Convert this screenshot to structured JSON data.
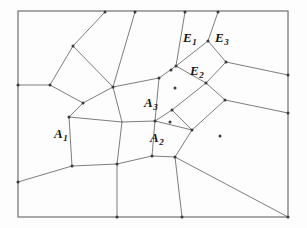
{
  "figure": {
    "background_color": "#fdfdfd",
    "line_color": "#6e6e6e",
    "border_color": "#707070",
    "vertex_color": "#3a3a3a",
    "label_color": "#141414",
    "frame": {
      "x": 18,
      "y": 11,
      "width": 270,
      "height": 206
    }
  },
  "labels": [
    {
      "id": "A1",
      "base": "A",
      "sub": "1",
      "x": 54,
      "y": 125
    },
    {
      "id": "A2",
      "base": "A",
      "sub": "2",
      "x": 150,
      "y": 129
    },
    {
      "id": "A3",
      "base": "A",
      "sub": "3",
      "x": 144,
      "y": 94
    },
    {
      "id": "E1",
      "base": "E",
      "sub": "1",
      "x": 183,
      "y": 29
    },
    {
      "id": "E2",
      "base": "E",
      "sub": "2",
      "x": 190,
      "y": 62
    },
    {
      "id": "E3",
      "base": "E",
      "sub": "3",
      "x": 215,
      "y": 29
    }
  ],
  "vertices": [
    {
      "id": "v1",
      "x": 73,
      "y": 46
    },
    {
      "id": "v2",
      "x": 50,
      "y": 85
    },
    {
      "id": "v3",
      "x": 83,
      "y": 103
    },
    {
      "id": "v4",
      "x": 69,
      "y": 117
    },
    {
      "id": "v5",
      "x": 72,
      "y": 166
    },
    {
      "id": "v6",
      "x": 117,
      "y": 164
    },
    {
      "id": "v7",
      "x": 152,
      "y": 156
    },
    {
      "id": "v8",
      "x": 175,
      "y": 157
    },
    {
      "id": "v9",
      "x": 155,
      "y": 121
    },
    {
      "id": "v10",
      "x": 170,
      "y": 122
    },
    {
      "id": "v11",
      "x": 172,
      "y": 110
    },
    {
      "id": "v12",
      "x": 192,
      "y": 130
    },
    {
      "id": "v13",
      "x": 175,
      "y": 88
    },
    {
      "id": "v14",
      "x": 171,
      "y": 70
    },
    {
      "id": "v15",
      "x": 176,
      "y": 66
    },
    {
      "id": "v16",
      "x": 206,
      "y": 83
    },
    {
      "id": "v17",
      "x": 225,
      "y": 100
    },
    {
      "id": "v18",
      "x": 208,
      "y": 41
    },
    {
      "id": "v19",
      "x": 226,
      "y": 62
    },
    {
      "id": "v20",
      "x": 220,
      "y": 136
    },
    {
      "id": "v21",
      "x": 105,
      "y": 12
    },
    {
      "id": "v22",
      "x": 135,
      "y": 12
    },
    {
      "id": "v23",
      "x": 185,
      "y": 12
    },
    {
      "id": "v24",
      "x": 218,
      "y": 12
    },
    {
      "id": "v25",
      "x": 18,
      "y": 85
    },
    {
      "id": "v26",
      "x": 18,
      "y": 182
    },
    {
      "id": "v27",
      "x": 288,
      "y": 75
    },
    {
      "id": "v28",
      "x": 288,
      "y": 113
    },
    {
      "id": "v29",
      "x": 117,
      "y": 217
    },
    {
      "id": "v30",
      "x": 182,
      "y": 217
    },
    {
      "id": "v31",
      "x": 288,
      "y": 217
    },
    {
      "id": "v32",
      "x": 159,
      "y": 78
    },
    {
      "id": "v33",
      "x": 113,
      "y": 87
    }
  ],
  "edges": [
    {
      "from": [
        18,
        11
      ],
      "to": [
        288,
        11
      ],
      "kind": "frame-top"
    },
    {
      "from": [
        288,
        11
      ],
      "to": [
        288,
        217
      ],
      "kind": "frame-right"
    },
    {
      "from": [
        288,
        217
      ],
      "to": [
        18,
        217
      ],
      "kind": "frame-bottom"
    },
    {
      "from": [
        18,
        217
      ],
      "to": [
        18,
        11
      ],
      "kind": "frame-left"
    },
    {
      "from": [
        105,
        12
      ],
      "to": [
        73,
        46
      ],
      "kind": "cell"
    },
    {
      "from": [
        73,
        46
      ],
      "to": [
        50,
        85
      ],
      "kind": "cell"
    },
    {
      "from": [
        50,
        85
      ],
      "to": [
        18,
        85
      ],
      "kind": "cell"
    },
    {
      "from": [
        50,
        85
      ],
      "to": [
        83,
        103
      ],
      "kind": "cell"
    },
    {
      "from": [
        73,
        46
      ],
      "to": [
        113,
        87
      ],
      "kind": "cell"
    },
    {
      "from": [
        135,
        12
      ],
      "to": [
        113,
        87
      ],
      "kind": "cell"
    },
    {
      "from": [
        113,
        87
      ],
      "to": [
        83,
        103
      ],
      "kind": "cell"
    },
    {
      "from": [
        83,
        103
      ],
      "to": [
        69,
        117
      ],
      "kind": "cell"
    },
    {
      "from": [
        69,
        117
      ],
      "to": [
        72,
        166
      ],
      "kind": "cell"
    },
    {
      "from": [
        72,
        166
      ],
      "to": [
        18,
        182
      ],
      "kind": "cell"
    },
    {
      "from": [
        72,
        166
      ],
      "to": [
        117,
        164
      ],
      "kind": "cell"
    },
    {
      "from": [
        117,
        164
      ],
      "to": [
        117,
        217
      ],
      "kind": "cell"
    },
    {
      "from": [
        117,
        164
      ],
      "to": [
        152,
        156
      ],
      "kind": "cell"
    },
    {
      "from": [
        69,
        117
      ],
      "to": [
        122,
        122
      ],
      "kind": "cell"
    },
    {
      "from": [
        122,
        122
      ],
      "to": [
        117,
        164
      ],
      "kind": "cell"
    },
    {
      "from": [
        122,
        122
      ],
      "to": [
        113,
        87
      ],
      "kind": "cell"
    },
    {
      "from": [
        122,
        122
      ],
      "to": [
        155,
        121
      ],
      "kind": "cell"
    },
    {
      "from": [
        155,
        121
      ],
      "to": [
        152,
        156
      ],
      "kind": "cell"
    },
    {
      "from": [
        152,
        156
      ],
      "to": [
        175,
        157
      ],
      "kind": "cell"
    },
    {
      "from": [
        175,
        157
      ],
      "to": [
        182,
        217
      ],
      "kind": "cell"
    },
    {
      "from": [
        175,
        157
      ],
      "to": [
        192,
        130
      ],
      "kind": "cell"
    },
    {
      "from": [
        175,
        157
      ],
      "to": [
        288,
        217
      ],
      "kind": "cell"
    },
    {
      "from": [
        155,
        121
      ],
      "to": [
        159,
        78
      ],
      "kind": "cell"
    },
    {
      "from": [
        113,
        87
      ],
      "to": [
        159,
        78
      ],
      "kind": "cell"
    },
    {
      "from": [
        159,
        78
      ],
      "to": [
        176,
        66
      ],
      "kind": "cell"
    },
    {
      "from": [
        185,
        12
      ],
      "to": [
        176,
        66
      ],
      "kind": "cell"
    },
    {
      "from": [
        176,
        66
      ],
      "to": [
        206,
        83
      ],
      "kind": "cell"
    },
    {
      "from": [
        218,
        12
      ],
      "to": [
        208,
        41
      ],
      "kind": "cell"
    },
    {
      "from": [
        208,
        41
      ],
      "to": [
        176,
        66
      ],
      "kind": "cell"
    },
    {
      "from": [
        208,
        41
      ],
      "to": [
        226,
        62
      ],
      "kind": "cell"
    },
    {
      "from": [
        226,
        62
      ],
      "to": [
        206,
        83
      ],
      "kind": "cell"
    },
    {
      "from": [
        226,
        62
      ],
      "to": [
        288,
        75
      ],
      "kind": "cell"
    },
    {
      "from": [
        206,
        83
      ],
      "to": [
        172,
        110
      ],
      "kind": "cell"
    },
    {
      "from": [
        172,
        110
      ],
      "to": [
        155,
        121
      ],
      "kind": "cell"
    },
    {
      "from": [
        172,
        110
      ],
      "to": [
        192,
        130
      ],
      "kind": "cell"
    },
    {
      "from": [
        192,
        130
      ],
      "to": [
        225,
        100
      ],
      "kind": "cell"
    },
    {
      "from": [
        225,
        100
      ],
      "to": [
        206,
        83
      ],
      "kind": "cell"
    },
    {
      "from": [
        225,
        100
      ],
      "to": [
        288,
        113
      ],
      "kind": "cell"
    },
    {
      "from": [
        192,
        130
      ],
      "to": [
        155,
        121
      ],
      "kind": "cell"
    }
  ]
}
